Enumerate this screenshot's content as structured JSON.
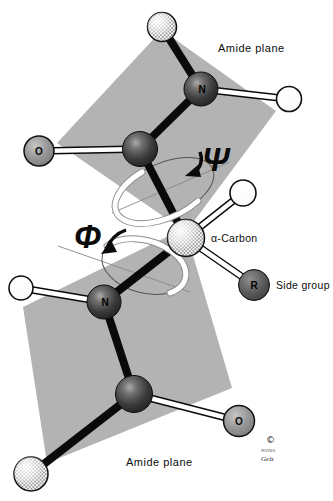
{
  "figure": {
    "labels": {
      "amide_plane": "Amide plane",
      "psi": "Ψ",
      "phi": "Φ",
      "alpha_carbon": "α-Carbon",
      "side_group": "Side group",
      "n_atom": "N",
      "o_atom": "O",
      "r_atom": "R",
      "copyright": "©",
      "signature_top": "IRVING",
      "signature_bottom": "Geis"
    },
    "colors": {
      "background": "#ffffff",
      "plane": "#b3b3b3",
      "bond": "#0a0a0a",
      "rod_core": "#ffffff",
      "dark_atom": "#3c3c3c",
      "oxygen_atom": "#8e8e8e",
      "side_atom": "#545454",
      "hydrogen_atom": "#ffffff",
      "ribbon": "#ffffff"
    }
  }
}
